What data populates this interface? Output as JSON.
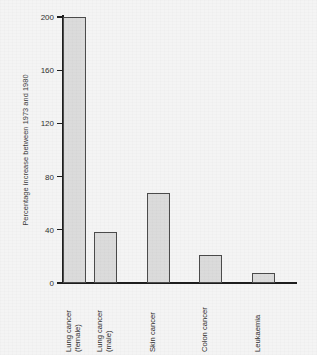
{
  "chart_data": {
    "type": "bar",
    "title": "",
    "subtitle": "",
    "xlabel": "",
    "ylabel": "Percentage increase between 1973 and 1980",
    "categories": [
      "Lung cancer (female)",
      "Lung cancer (male)",
      "Skin cancer",
      "Colon cancer",
      "Leukaemia"
    ],
    "category_lines": [
      [
        "Lung cancer",
        "(female)"
      ],
      [
        "Lung cancer",
        "(male)"
      ],
      [
        "Skin cancer",
        ""
      ],
      [
        "Colon cancer",
        ""
      ],
      [
        "Leukaemia",
        ""
      ]
    ],
    "values": [
      200,
      38,
      68,
      21,
      7.5
    ],
    "ylim": [
      0,
      200
    ],
    "yticks": [
      0,
      40,
      80,
      120,
      160,
      200
    ],
    "ytick_labels": [
      "0",
      "40",
      "80",
      "120",
      "160",
      "200"
    ],
    "grid": false,
    "legend": null,
    "legend_position": "none",
    "orientation": "vertical",
    "bar_color": "#dbdbdb",
    "bar_edge_color": "#4b4b4b",
    "axis_color": "#1d1d1d",
    "background_color": "#f4f4f4",
    "text_color": "#303030"
  }
}
